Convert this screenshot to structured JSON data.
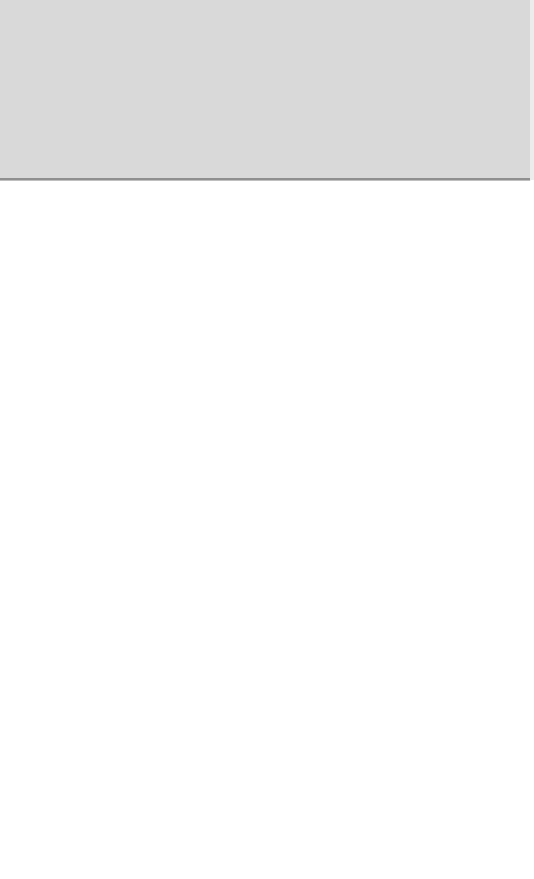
{
  "header": {
    "background_color": "#d9d9d9",
    "border_color": "#8f8f8f"
  },
  "content": {
    "background_color": "#ffffff"
  }
}
